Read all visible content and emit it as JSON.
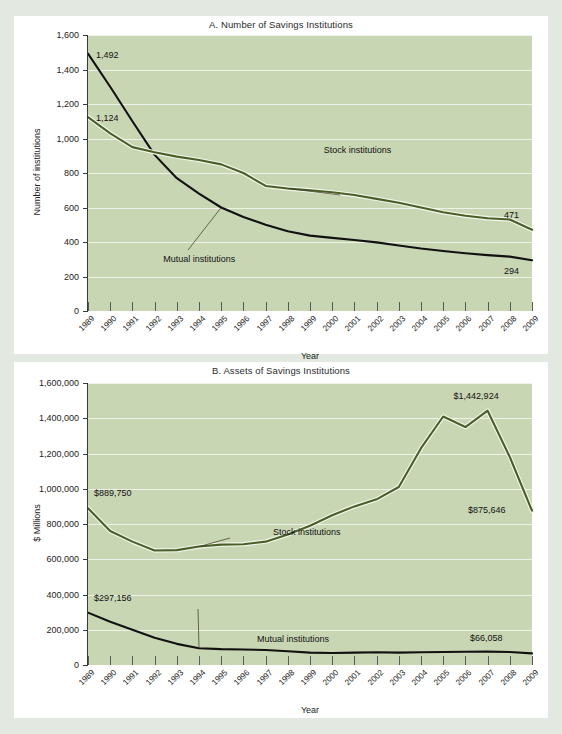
{
  "colors": {
    "page_background": "#e3e9e0",
    "card_background": "#ffffff",
    "plot_background": "#c9d6b4",
    "gridline": "#eef2e7",
    "stock_line": "#4a5e28",
    "mutual_line": "#111111",
    "axis": "#3a3a3a",
    "text": "#1d1d1d"
  },
  "chart_data": [
    {
      "id": "chart-a",
      "type": "line",
      "title": "A. Number of Savings Institutions",
      "xlabel": "Year",
      "ylabel": "Number of institutions",
      "ylim": [
        0,
        1600
      ],
      "ytick_labels": [
        "1,600",
        "1,400",
        "1,200",
        "1,000",
        "800",
        "600",
        "400",
        "200",
        "0"
      ],
      "ytick_values": [
        1600,
        1400,
        1200,
        1000,
        800,
        600,
        400,
        200,
        0
      ],
      "grid": true,
      "legend_position": "inline-callout",
      "categories": [
        "1989",
        "1990",
        "1991",
        "1992",
        "1993",
        "1994",
        "1995",
        "1996",
        "1997",
        "1998",
        "1999",
        "2000",
        "2001",
        "2002",
        "2003",
        "2004",
        "2005",
        "2006",
        "2007",
        "2008",
        "2009"
      ],
      "series": [
        {
          "name": "Mutual institutions",
          "color": "#111111",
          "values": [
            1492,
            1300,
            1100,
            905,
            770,
            680,
            600,
            545,
            500,
            462,
            437,
            424,
            412,
            398,
            380,
            362,
            348,
            335,
            324,
            315,
            294
          ]
        },
        {
          "name": "Stock institutions",
          "color": "#4a5e28",
          "values": [
            1124,
            1030,
            950,
            920,
            895,
            875,
            850,
            800,
            725,
            710,
            700,
            688,
            672,
            650,
            628,
            600,
            572,
            552,
            538,
            530,
            471
          ]
        }
      ],
      "annotations": [
        {
          "text": "1,492",
          "series": "Mutual institutions",
          "year": "1989"
        },
        {
          "text": "1,124",
          "series": "Stock institutions",
          "year": "1989"
        },
        {
          "text": "471",
          "series": "Stock institutions",
          "year": "2009"
        },
        {
          "text": "294",
          "series": "Mutual institutions",
          "year": "2009"
        },
        {
          "text": "Stock institutions",
          "series": "Stock institutions",
          "year": "1998"
        },
        {
          "text": "Mutual institutions",
          "series": "Mutual institutions",
          "year": "1995"
        }
      ]
    },
    {
      "id": "chart-b",
      "type": "line",
      "title": "B. Assets of Savings Institutions",
      "xlabel": "Year",
      "ylabel": "$ Millions",
      "ylim": [
        0,
        1600000
      ],
      "ytick_labels": [
        "1,600,000",
        "1,400,000",
        "1,200,000",
        "1,000,000",
        "800,000",
        "600,000",
        "400,000",
        "200,000",
        "0"
      ],
      "ytick_values": [
        1600000,
        1400000,
        1200000,
        1000000,
        800000,
        600000,
        400000,
        200000,
        0
      ],
      "grid": true,
      "legend_position": "inline-callout",
      "categories": [
        "1989",
        "1990",
        "1991",
        "1992",
        "1993",
        "1994",
        "1995",
        "1996",
        "1997",
        "1998",
        "1999",
        "2000",
        "2001",
        "2002",
        "2003",
        "2004",
        "2005",
        "2006",
        "2007",
        "2008",
        "2009"
      ],
      "series": [
        {
          "name": "Stock institutions",
          "color": "#4a5e28",
          "values": [
            889750,
            760000,
            700000,
            650000,
            652000,
            672000,
            683000,
            685000,
            700000,
            740000,
            790000,
            850000,
            900000,
            940000,
            1010000,
            1230000,
            1410000,
            1350000,
            1442924,
            1180000,
            875646
          ]
        },
        {
          "name": "Mutual institutions",
          "color": "#111111",
          "values": [
            297156,
            245000,
            200000,
            155000,
            120000,
            95000,
            90000,
            88000,
            85000,
            78000,
            70000,
            68000,
            70000,
            72000,
            70000,
            72000,
            74000,
            75000,
            76000,
            74000,
            66058
          ]
        }
      ],
      "annotations": [
        {
          "text": "$889,750",
          "series": "Stock institutions",
          "year": "1989"
        },
        {
          "text": "$1,442,924",
          "series": "Stock institutions",
          "year": "2007"
        },
        {
          "text": "$875,646",
          "series": "Stock institutions",
          "year": "2009"
        },
        {
          "text": "$297,156",
          "series": "Mutual institutions",
          "year": "1989"
        },
        {
          "text": "$66,058",
          "series": "Mutual institutions",
          "year": "2009"
        },
        {
          "text": "Stock institutions",
          "series": "Stock institutions",
          "year": "1994"
        },
        {
          "text": "Mutual institutions",
          "series": "Mutual institutions",
          "year": "1994"
        }
      ]
    }
  ]
}
